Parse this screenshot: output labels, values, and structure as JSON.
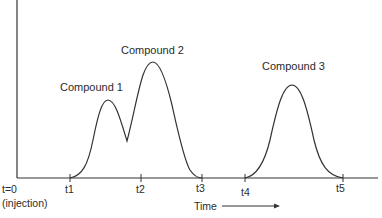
{
  "diagram": {
    "type": "chromatogram",
    "line_color": "#333333",
    "text_color": "#2b2b2b",
    "axis": {
      "x_label": "Time",
      "origin_label_line1": "t=0",
      "origin_label_line2": "(injection)"
    },
    "ticks": [
      {
        "label": "t1",
        "x": 70
      },
      {
        "label": "t2",
        "x": 141
      },
      {
        "label": "t3",
        "x": 202
      },
      {
        "label": "t4",
        "x": 245
      },
      {
        "label": "t5",
        "x": 343
      }
    ],
    "peaks": [
      {
        "label": "Compound 1",
        "apex_x": 108,
        "apex_y": 100
      },
      {
        "label": "Compound 2",
        "apex_x": 152,
        "apex_y": 62
      },
      {
        "label": "Compound 3",
        "apex_x": 292,
        "apex_y": 85
      }
    ],
    "valley": {
      "x": 127,
      "y": 141
    }
  }
}
